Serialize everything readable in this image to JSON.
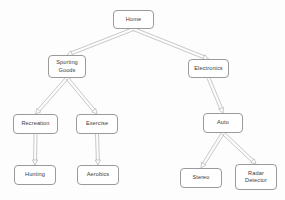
{
  "diagram": {
    "type": "tree-hierarchy",
    "background_color": "#fdfdfd",
    "node_border_color": "#9a9a9a",
    "node_fill_color": "#ffffff",
    "text_color": "#3a3a3a",
    "connector_color": "#b0b0b0",
    "nodes": [
      {
        "id": "home",
        "label": "Home",
        "x": 113,
        "y": 10,
        "w": 41,
        "h": 19
      },
      {
        "id": "sporting",
        "label": "Sporting\nGoods",
        "x": 48,
        "y": 55,
        "w": 38,
        "h": 23
      },
      {
        "id": "electronics",
        "label": "Electronics",
        "x": 188,
        "y": 59,
        "w": 41,
        "h": 19
      },
      {
        "id": "recreation",
        "label": "Recreation",
        "x": 13,
        "y": 114,
        "w": 45,
        "h": 20
      },
      {
        "id": "exercise",
        "label": "Exercise",
        "x": 76,
        "y": 114,
        "w": 42,
        "h": 20
      },
      {
        "id": "auto",
        "label": "Auto",
        "x": 203,
        "y": 113,
        "w": 40,
        "h": 20
      },
      {
        "id": "hunting",
        "label": "Hunting",
        "x": 14,
        "y": 165,
        "w": 42,
        "h": 20
      },
      {
        "id": "aerobics",
        "label": "Aerobics",
        "x": 77,
        "y": 165,
        "w": 42,
        "h": 20
      },
      {
        "id": "stereo",
        "label": "Stereo",
        "x": 180,
        "y": 168,
        "w": 42,
        "h": 20
      },
      {
        "id": "radar",
        "label": "Radar\nDetector",
        "x": 235,
        "y": 164,
        "w": 42,
        "h": 26
      }
    ],
    "edges": [
      {
        "from": "home",
        "to": "sporting"
      },
      {
        "from": "home",
        "to": "electronics"
      },
      {
        "from": "sporting",
        "to": "recreation"
      },
      {
        "from": "sporting",
        "to": "exercise"
      },
      {
        "from": "electronics",
        "to": "auto"
      },
      {
        "from": "recreation",
        "to": "hunting"
      },
      {
        "from": "exercise",
        "to": "aerobics"
      },
      {
        "from": "auto",
        "to": "stereo"
      },
      {
        "from": "auto",
        "to": "radar"
      }
    ]
  }
}
